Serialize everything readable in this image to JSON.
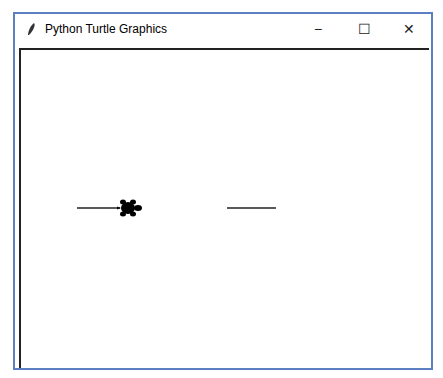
{
  "window": {
    "title": "Python Turtle Graphics",
    "icon": "feather-icon",
    "controls": {
      "minimize": "−",
      "maximize": "☐",
      "close": "✕"
    },
    "border_color": "#5b7fc0"
  },
  "canvas": {
    "background": "#ffffff",
    "lines": [
      {
        "x1": 77,
        "y1": 208,
        "x2": 120,
        "y2": 208
      },
      {
        "x1": 227,
        "y1": 208,
        "x2": 276,
        "y2": 208
      }
    ],
    "turtle": {
      "x": 128,
      "y": 208,
      "heading": "east",
      "color": "#000000"
    }
  }
}
